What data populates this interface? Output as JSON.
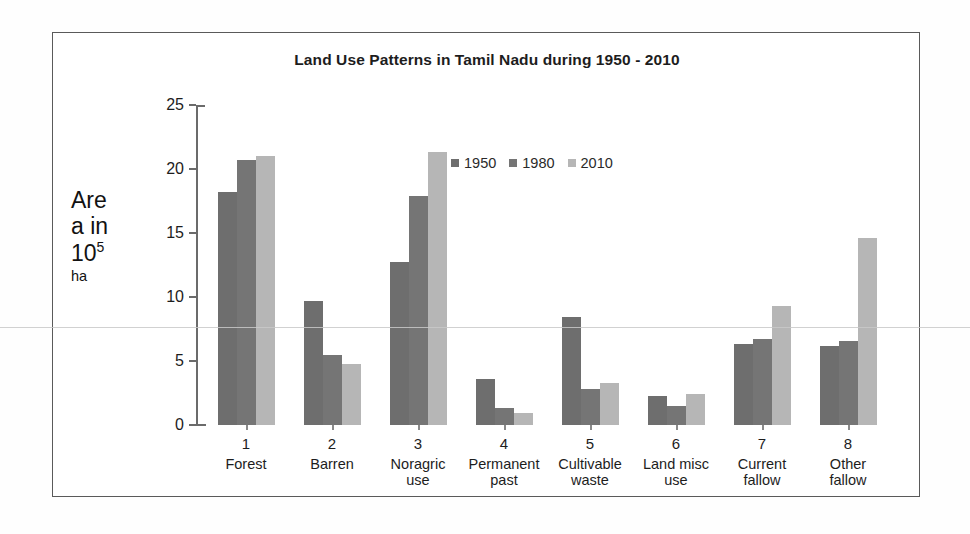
{
  "chart_data": {
    "type": "bar",
    "title": "Land Use Patterns in Tamil Nadu during 1950 - 2010",
    "xlabel": "",
    "ylabel": "Are a in 10⁵ ha",
    "ylabel_lines": [
      "Are",
      "a in",
      "10",
      "ha"
    ],
    "ylabel_superscript": "5",
    "ylim": [
      0,
      25
    ],
    "ytick_step": 5,
    "yticks": [
      0,
      5,
      10,
      15,
      20,
      25
    ],
    "ytick_labels": [
      "0",
      "5",
      "10",
      "15",
      "20",
      "25"
    ],
    "grid": false,
    "legend_position": "upper-center",
    "categories": [
      "Forest",
      "Barren",
      "Noragric use",
      "Permanent past",
      "Cultivable waste",
      "Land misc use",
      "Current fallow",
      "Other fallow"
    ],
    "category_numbers": [
      "1",
      "2",
      "3",
      "4",
      "5",
      "6",
      "7",
      "8"
    ],
    "category_lines": [
      [
        "Forest"
      ],
      [
        "Barren"
      ],
      [
        "Noragric",
        "use"
      ],
      [
        "Permanent",
        "past"
      ],
      [
        "Cultivable",
        "waste"
      ],
      [
        "Land misc",
        "use"
      ],
      [
        "Current",
        "fallow"
      ],
      [
        "Other",
        "fallow"
      ]
    ],
    "series": [
      {
        "name": "1950",
        "color": "#6e6e6e",
        "values": [
          18.2,
          9.7,
          12.7,
          3.6,
          8.4,
          2.3,
          6.3,
          6.2
        ]
      },
      {
        "name": "1980",
        "color": "#757575",
        "values": [
          20.7,
          5.5,
          17.9,
          1.3,
          2.8,
          1.5,
          6.7,
          6.6
        ]
      },
      {
        "name": "2010",
        "color": "#b6b6b6",
        "values": [
          21.0,
          4.8,
          21.3,
          0.9,
          3.3,
          2.4,
          9.3,
          14.6
        ]
      }
    ]
  },
  "colors": {
    "series_1950": "#6e6e6e",
    "series_1980": "#757575",
    "series_2010": "#b6b6b6",
    "axis": "#6b6b6b",
    "frame": "#5a5a5a",
    "text": "#1d1d1d",
    "background": "#ffffff"
  }
}
